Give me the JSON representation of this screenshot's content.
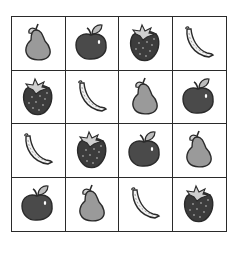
{
  "grid": {
    "rows": 4,
    "cols": 4,
    "cells": [
      [
        "pear",
        "apple",
        "strawberry",
        "banana"
      ],
      [
        "strawberry",
        "banana",
        "pear",
        "apple"
      ],
      [
        "banana",
        "strawberry",
        "apple",
        "pear"
      ],
      [
        "apple",
        "pear",
        "banana",
        "strawberry"
      ]
    ]
  },
  "colors": {
    "outline": "#2a2a2a",
    "pear": "#9a9a9a",
    "apple": "#4a4a4a",
    "strawberry": "#3c3c3c",
    "banana": "#f2f2f2",
    "leaf": "#bdbdbd"
  }
}
